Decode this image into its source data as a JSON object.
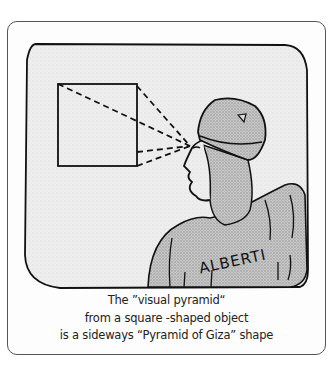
{
  "illustration": {
    "name_label": "ALBERTI",
    "subject": "man in turban looking at square object with dashed sight lines"
  },
  "caption": {
    "line1": "The ”visual pyramid“",
    "line2": "from a square -shaped object",
    "line3": "is a sideways  “Pyramid of Giza” shape"
  }
}
